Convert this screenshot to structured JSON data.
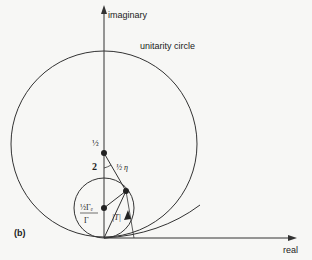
{
  "figure": {
    "panel_label": "(b)",
    "axes": {
      "vertical_label": "imaginary",
      "horizontal_label": "real"
    },
    "unitarity_circle_label": "unitarity circle",
    "labels": {
      "half_center": "½",
      "two": "2",
      "half_eta": "½ η",
      "partial_width_num": "½Γₑ",
      "partial_width_den": "Γ",
      "amplitude": "|T|"
    },
    "colors": {
      "line": "#333333",
      "background": "#f7f7f5"
    }
  }
}
